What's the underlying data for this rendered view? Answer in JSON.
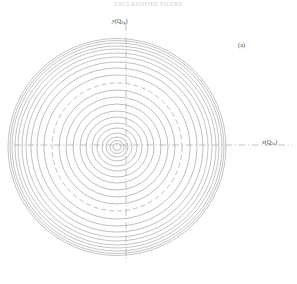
{
  "figure": {
    "header_text": "UNCLASSIFIED  FIGURE",
    "panel_label": "(a)",
    "y_axis_label_var": "y",
    "y_axis_label_arg": "(Q",
    "y_axis_label_sub": "2p",
    "y_axis_label_close": ")",
    "x_axis_label_var": "x",
    "x_axis_label_arg": "(Q",
    "x_axis_label_sub": "2a",
    "x_axis_label_close": ")"
  },
  "chart_data": {
    "type": "line",
    "title": "",
    "subtitle": "",
    "xlabel": "x(Q2a)",
    "ylabel": "y (Q2p)",
    "annotations": [
      "(a)"
    ],
    "legend_position": "none",
    "grid": false,
    "axis_style": "dash-dot crosshair through origin",
    "plot_description": "Concentric closed contour lines (potential energy surface / equipotential map) centered near the origin; contour spacing decreases toward the outer edge.",
    "center": {
      "x": 117,
      "y": 147
    },
    "origin_crossing": {
      "x": 126,
      "y": 145
    },
    "contour_count": 22,
    "dashed_contour_index": 12,
    "contours": [
      {
        "i": 1,
        "rx": 4,
        "ry": 3.5,
        "style": "solid"
      },
      {
        "i": 2,
        "rx": 7,
        "ry": 6.5,
        "style": "solid"
      },
      {
        "i": 3,
        "rx": 11,
        "ry": 10,
        "style": "solid"
      },
      {
        "i": 4,
        "rx": 15,
        "ry": 14,
        "style": "solid"
      },
      {
        "i": 5,
        "rx": 20,
        "ry": 19,
        "style": "solid"
      },
      {
        "i": 6,
        "rx": 25,
        "ry": 24,
        "style": "solid"
      },
      {
        "i": 7,
        "rx": 31,
        "ry": 30,
        "style": "solid"
      },
      {
        "i": 8,
        "rx": 37,
        "ry": 36,
        "style": "solid"
      },
      {
        "i": 9,
        "rx": 44,
        "ry": 43,
        "style": "solid"
      },
      {
        "i": 10,
        "rx": 51,
        "ry": 50,
        "style": "solid"
      },
      {
        "i": 11,
        "rx": 58,
        "ry": 57,
        "style": "solid"
      },
      {
        "i": 12,
        "rx": 65,
        "ry": 64,
        "style": "dashed"
      },
      {
        "i": 13,
        "rx": 73,
        "ry": 72,
        "style": "solid"
      },
      {
        "i": 14,
        "rx": 80,
        "ry": 79,
        "style": "solid"
      },
      {
        "i": 15,
        "rx": 86,
        "ry": 85,
        "style": "solid"
      },
      {
        "i": 16,
        "rx": 91,
        "ry": 90,
        "style": "solid"
      },
      {
        "i": 17,
        "rx": 95,
        "ry": 94,
        "style": "solid"
      },
      {
        "i": 18,
        "rx": 99,
        "ry": 98,
        "style": "solid"
      },
      {
        "i": 19,
        "rx": 102,
        "ry": 101,
        "style": "solid"
      },
      {
        "i": 20,
        "rx": 105,
        "ry": 104,
        "style": "solid"
      },
      {
        "i": 21,
        "rx": 107,
        "ry": 106.5,
        "style": "solid"
      },
      {
        "i": 22,
        "rx": 109,
        "ry": 108.5,
        "style": "solid"
      }
    ],
    "colors": {
      "contour_line": "#8a8a8a",
      "axis_line": "#9a9a9a",
      "text": "#4a4a4a",
      "background": "#ffffff"
    }
  }
}
